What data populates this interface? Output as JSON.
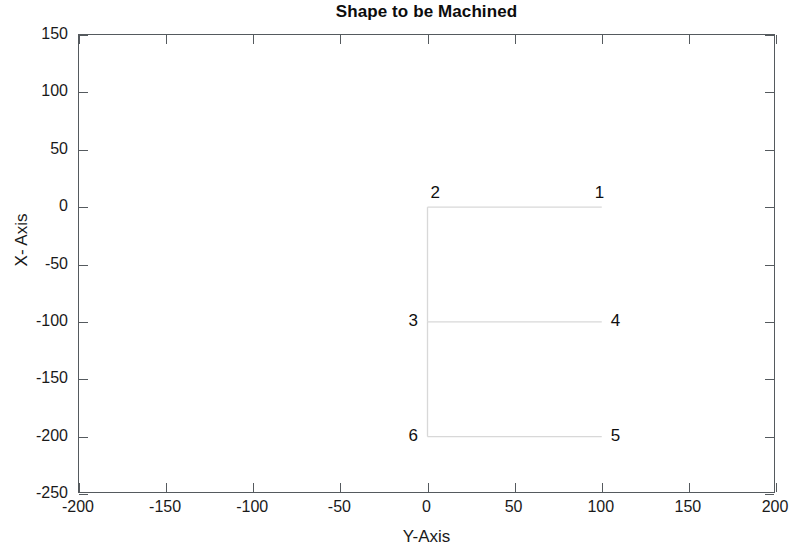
{
  "chart_data": {
    "type": "line",
    "title": "Shape to be Machined",
    "xlabel": "Y-Axis",
    "ylabel": "X- Axis",
    "grid": false,
    "legend": null,
    "xlim": [
      -200,
      200
    ],
    "ylim": [
      -250,
      150
    ],
    "xticks": [
      -200,
      -150,
      -100,
      -50,
      0,
      50,
      100,
      150,
      200
    ],
    "xticklabels": [
      "-200",
      "-150",
      "-100",
      "-50",
      "0",
      "50",
      "100",
      "150",
      "200"
    ],
    "yticks": [
      150,
      100,
      50,
      0,
      -50,
      -100,
      -150,
      -200,
      -250
    ],
    "yticklabels": [
      "150",
      "100",
      "50",
      "0",
      "-50",
      "-100",
      "-150",
      "-200",
      "-250"
    ],
    "line_color": "#d8d8d8",
    "annotation_color": "#0f0f0f",
    "series": [
      {
        "name": "machined-profile",
        "comment": "open polyline: top edge 1->2, down left edge to 3, across to 4, back and down to 6, across to 5",
        "segments": [
          {
            "name": "top-edge",
            "x": [
              0,
              100
            ],
            "y": [
              0,
              0
            ]
          },
          {
            "name": "left-edge-upper",
            "x": [
              0,
              0
            ],
            "y": [
              0,
              -100
            ]
          },
          {
            "name": "middle-edge",
            "x": [
              0,
              100
            ],
            "y": [
              -100,
              -100
            ]
          },
          {
            "name": "left-edge-lower",
            "x": [
              0,
              0
            ],
            "y": [
              -100,
              -200
            ]
          },
          {
            "name": "bottom-edge",
            "x": [
              0,
              100
            ],
            "y": [
              -200,
              -200
            ]
          }
        ]
      }
    ],
    "annotations": [
      {
        "label": "1",
        "x": 100,
        "y": 0,
        "position": "above-left"
      },
      {
        "label": "2",
        "x": 0,
        "y": 0,
        "position": "above-right"
      },
      {
        "label": "3",
        "x": 0,
        "y": -100,
        "position": "left"
      },
      {
        "label": "4",
        "x": 100,
        "y": -100,
        "position": "right"
      },
      {
        "label": "5",
        "x": 100,
        "y": -200,
        "position": "right"
      },
      {
        "label": "6",
        "x": 0,
        "y": -200,
        "position": "left"
      }
    ]
  }
}
